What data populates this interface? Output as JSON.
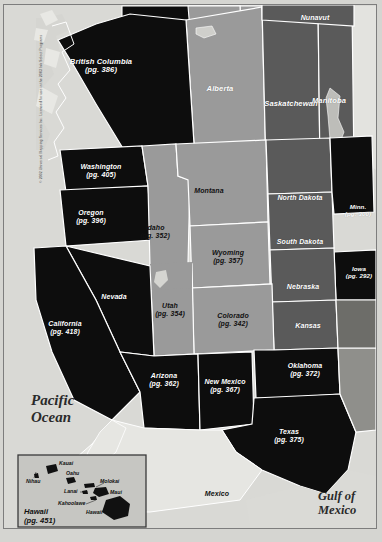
{
  "map": {
    "title": "Western United States and Canada Road Atlas Index Map",
    "copyright": "© 2002 Universal Mapping Services Inc. Licensed for use in the 2003 Ink Select Programs",
    "palette": {
      "dark_state": "#0d0d0d",
      "light_state": "#9a9a9a",
      "mid_state": "#5a5a5a",
      "water": "#d5d5d1",
      "land_outside": "#e2e2de",
      "border": "#ffffff",
      "frame": "#7d7d7d"
    },
    "water_labels": [
      {
        "name": "pacific-ocean",
        "line1": "Pacific",
        "line2": "Ocean"
      },
      {
        "name": "gulf-of-mexico",
        "line1": "Gulf of",
        "line2": "Mexico"
      }
    ],
    "regions": [
      {
        "name": "british-columbia",
        "label": "British Columbia",
        "page": "(pg. 386)",
        "shade": "dark"
      },
      {
        "name": "alberta",
        "label": "Alberta",
        "page": "",
        "shade": "light"
      },
      {
        "name": "saskatchewan",
        "label": "Saskatchewan",
        "page": "",
        "shade": "mid"
      },
      {
        "name": "manitoba",
        "label": "Manitoba",
        "page": "",
        "shade": "mid"
      },
      {
        "name": "nunavut",
        "label": "Nunavut",
        "page": "",
        "shade": "mid"
      },
      {
        "name": "washington",
        "label": "Washington",
        "page": "(pg. 405)",
        "shade": "dark"
      },
      {
        "name": "oregon",
        "label": "Oregon",
        "page": "(pg. 396)",
        "shade": "dark"
      },
      {
        "name": "idaho",
        "label": "Idaho",
        "page": "(pg. 352)",
        "shade": "light"
      },
      {
        "name": "montana",
        "label": "Montana",
        "page": "",
        "shade": "light"
      },
      {
        "name": "wyoming",
        "label": "Wyoming",
        "page": "(pg. 357)",
        "shade": "light"
      },
      {
        "name": "north-dakota",
        "label": "North Dakota",
        "page": "",
        "shade": "mid"
      },
      {
        "name": "south-dakota",
        "label": "South Dakota",
        "page": "",
        "shade": "mid"
      },
      {
        "name": "nebraska",
        "label": "Nebraska",
        "page": "",
        "shade": "mid"
      },
      {
        "name": "minnesota",
        "label": "Minn.",
        "page": "(pg. 300)",
        "shade": "dark"
      },
      {
        "name": "iowa",
        "label": "Iowa",
        "page": "(pg. 292)",
        "shade": "dark"
      },
      {
        "name": "kansas",
        "label": "Kansas",
        "page": "",
        "shade": "mid"
      },
      {
        "name": "nevada",
        "label": "Nevada",
        "page": "",
        "shade": "dark"
      },
      {
        "name": "utah",
        "label": "Utah",
        "page": "(pg. 354)",
        "shade": "light"
      },
      {
        "name": "colorado",
        "label": "Colorado",
        "page": "(pg. 342)",
        "shade": "light"
      },
      {
        "name": "california",
        "label": "California",
        "page": "(pg. 418)",
        "shade": "dark"
      },
      {
        "name": "arizona",
        "label": "Arizona",
        "page": "(pg. 362)",
        "shade": "dark"
      },
      {
        "name": "new-mexico",
        "label": "New Mexico",
        "page": "(pg. 367)",
        "shade": "dark"
      },
      {
        "name": "oklahoma",
        "label": "Oklahoma",
        "page": "(pg. 372)",
        "shade": "dark"
      },
      {
        "name": "texas",
        "label": "Texas",
        "page": "(pg. 375)",
        "shade": "dark"
      },
      {
        "name": "mexico",
        "label": "Mexico",
        "page": "",
        "shade": "outside"
      }
    ],
    "hawaii_inset": {
      "title": "Hawaii",
      "page": "(pg. 451)",
      "islands": [
        {
          "name": "kauai",
          "label": "Kauai"
        },
        {
          "name": "niihau",
          "label": "Nihau"
        },
        {
          "name": "oahu",
          "label": "Oahu"
        },
        {
          "name": "molokai",
          "label": "Molokai"
        },
        {
          "name": "lanai",
          "label": "Lanai"
        },
        {
          "name": "maui",
          "label": "Maui"
        },
        {
          "name": "kahoolawe",
          "label": "Kahoolawe"
        },
        {
          "name": "hawaii-island",
          "label": "Hawaii"
        }
      ]
    }
  }
}
